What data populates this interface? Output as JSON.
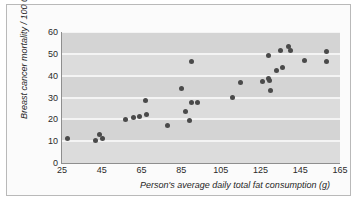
{
  "figure": {
    "background": "#ffffff",
    "plot_background": "#d4d4d4",
    "gridline_color": "#f4f4f4",
    "marker_color": "#4a4a4a",
    "caption": ""
  },
  "chart_data": {
    "type": "scatter",
    "title": "",
    "xlabel": "Person's average daily total fat consumption (g)",
    "ylabel": "Breast cancer mortality / 100 000",
    "xlim": [
      25,
      165
    ],
    "ylim": [
      0,
      60
    ],
    "xticks": [
      25,
      45,
      65,
      85,
      105,
      125,
      145,
      165
    ],
    "yticks": [
      0,
      10,
      20,
      30,
      40,
      50,
      60
    ],
    "grid": "horizontal",
    "legend": "none",
    "marker": "filled-circle",
    "points": [
      {
        "x": 28,
        "y": 11.2
      },
      {
        "x": 42,
        "y": 10.3
      },
      {
        "x": 44,
        "y": 13.2
      },
      {
        "x": 45.5,
        "y": 11.2
      },
      {
        "x": 57,
        "y": 20.0
      },
      {
        "x": 61,
        "y": 20.9
      },
      {
        "x": 64,
        "y": 21.5
      },
      {
        "x": 67,
        "y": 28.5
      },
      {
        "x": 67.5,
        "y": 22.4
      },
      {
        "x": 78,
        "y": 17.2
      },
      {
        "x": 85,
        "y": 34.2
      },
      {
        "x": 87,
        "y": 23.8
      },
      {
        "x": 90,
        "y": 46.6
      },
      {
        "x": 90,
        "y": 27.9
      },
      {
        "x": 89,
        "y": 19.4
      },
      {
        "x": 93,
        "y": 27.9
      },
      {
        "x": 111,
        "y": 30.2
      },
      {
        "x": 115,
        "y": 37.0
      },
      {
        "x": 126,
        "y": 37.5
      },
      {
        "x": 129,
        "y": 49.3
      },
      {
        "x": 129,
        "y": 38.6
      },
      {
        "x": 129.5,
        "y": 38.0
      },
      {
        "x": 130,
        "y": 33.3
      },
      {
        "x": 133,
        "y": 42.4
      },
      {
        "x": 135,
        "y": 51.4
      },
      {
        "x": 136,
        "y": 43.9
      },
      {
        "x": 139,
        "y": 53.2
      },
      {
        "x": 140,
        "y": 51.6
      },
      {
        "x": 147,
        "y": 47.0
      },
      {
        "x": 158,
        "y": 51.2
      },
      {
        "x": 158,
        "y": 46.5
      }
    ]
  }
}
